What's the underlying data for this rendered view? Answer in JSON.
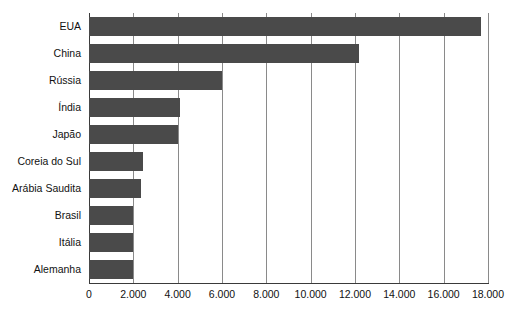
{
  "chart_data": {
    "type": "bar",
    "orientation": "horizontal",
    "title": "",
    "subtitle": "",
    "xlabel": "",
    "ylabel": "",
    "xlim": [
      0,
      18000
    ],
    "ylim": null,
    "grid": "vertical",
    "legend": "none",
    "bar_color": "#4a4a4a",
    "gridline_color": "#8a8a8a",
    "axis_color": "#3a3a3a",
    "background_color": "#ffffff",
    "categories": [
      "EUA",
      "China",
      "Rússia",
      "Índia",
      "Japão",
      "Coreia do Sul",
      "Arábia Saudita",
      "Brasil",
      "Itália",
      "Alemanha"
    ],
    "values": [
      17700,
      12200,
      6000,
      4100,
      4000,
      2450,
      2350,
      2000,
      2000,
      2000
    ],
    "xticks": [
      0,
      2000,
      4000,
      6000,
      8000,
      10000,
      12000,
      14000,
      16000,
      18000
    ],
    "xtick_labels": [
      "0",
      "2.000",
      "4.000",
      "6.000",
      "8.000",
      "10.000",
      "12.000",
      "14.000",
      "16.000",
      "18.000"
    ]
  }
}
